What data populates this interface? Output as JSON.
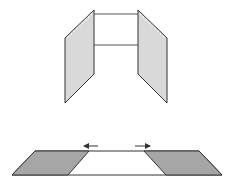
{
  "diagram": {
    "colors": {
      "panel_fill": "#d9d9d9",
      "flat_panel_fill": "#a6a6a6",
      "stroke": "#333333",
      "hinge_dots": "#ffffff",
      "background": "#ffffff"
    },
    "top_figure": {
      "label": "folded",
      "left_panel": [
        [
          94,
          10
        ],
        [
          65,
          38
        ],
        [
          65,
          103
        ],
        [
          94,
          74
        ]
      ],
      "right_panel": [
        [
          138,
          10
        ],
        [
          167,
          38
        ],
        [
          167,
          103
        ],
        [
          138,
          74
        ]
      ],
      "crossbars_y": [
        14,
        45
      ]
    },
    "bottom_figure": {
      "label": "unfolded",
      "left_panel": [
        [
          35,
          151
        ],
        [
          89,
          151
        ],
        [
          68,
          175
        ],
        [
          12,
          175
        ]
      ],
      "right_panel": [
        [
          144,
          151
        ],
        [
          199,
          151
        ],
        [
          222,
          175
        ],
        [
          166,
          175
        ]
      ],
      "arrows": [
        {
          "direction": "left",
          "from": [
            98,
            146
          ],
          "to": [
            84,
            146
          ]
        },
        {
          "direction": "right",
          "from": [
            135,
            146
          ],
          "to": [
            150,
            146
          ]
        }
      ]
    }
  }
}
